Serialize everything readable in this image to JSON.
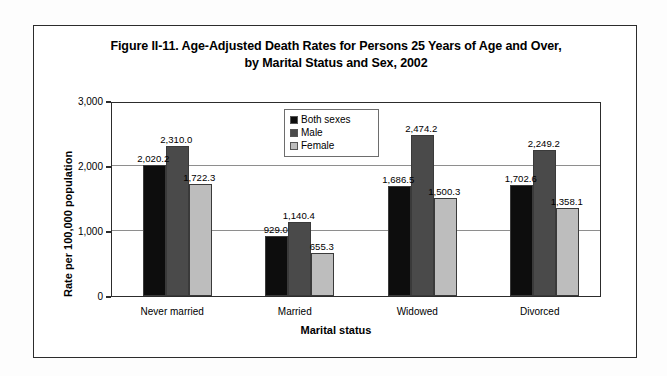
{
  "figure": {
    "title_line1": "Figure II-11. Age-Adjusted Death Rates for Persons 25 Years of Age and Over,",
    "title_line2": "by Marital Status and Sex, 2002"
  },
  "chart_data": {
    "type": "bar",
    "title": "Figure II-11. Age-Adjusted Death Rates for Persons 25 Years of Age and Over, by Marital Status and Sex, 2002",
    "xlabel": "Marital status",
    "ylabel": "Rate per 100,000 population",
    "categories": [
      "Never married",
      "Married",
      "Widowed",
      "Divorced"
    ],
    "series": [
      {
        "name": "Both sexes",
        "color": "#0d0d0d",
        "values": [
          2020.2,
          929.0,
          1686.5,
          1702.6
        ],
        "labels": [
          "2,020.2",
          "929.0",
          "1,686.5",
          "1,702.6"
        ]
      },
      {
        "name": "Male",
        "color": "#4a4a4a",
        "values": [
          2310.0,
          1140.4,
          2474.2,
          2249.2
        ],
        "labels": [
          "2,310.0",
          "1,140.4",
          "2,474.2",
          "2,249.2"
        ]
      },
      {
        "name": "Female",
        "color": "#bdbdbd",
        "values": [
          1722.3,
          655.3,
          1500.3,
          1358.1
        ],
        "labels": [
          "1,722.3",
          "655.3",
          "1,500.3",
          "1,358.1"
        ]
      }
    ],
    "ylim": [
      0,
      3000
    ],
    "yticks": [
      0,
      1000,
      2000,
      3000
    ],
    "ytick_labels": [
      "0",
      "1,000",
      "2,000",
      "3,000"
    ],
    "grid": true,
    "legend_position": "upper center",
    "legend_entries": [
      "Both sexes",
      "Male",
      "Female"
    ]
  }
}
